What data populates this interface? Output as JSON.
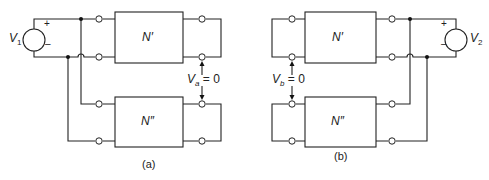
{
  "figure": {
    "panels": [
      {
        "id": "a",
        "caption": "(a)",
        "source": {
          "name": "V",
          "subscript": "1",
          "plus": "+",
          "minus": "–"
        },
        "top_network": "N′",
        "bottom_network": "N″",
        "measured_voltage": {
          "name": "V",
          "subscript": "a",
          "value": " = 0"
        }
      },
      {
        "id": "b",
        "caption": "(b)",
        "source": {
          "name": "V",
          "subscript": "2",
          "plus": "+",
          "minus": "–"
        },
        "top_network": "N′",
        "bottom_network": "N″",
        "measured_voltage": {
          "name": "V",
          "subscript": "b",
          "value": " = 0"
        }
      }
    ]
  }
}
